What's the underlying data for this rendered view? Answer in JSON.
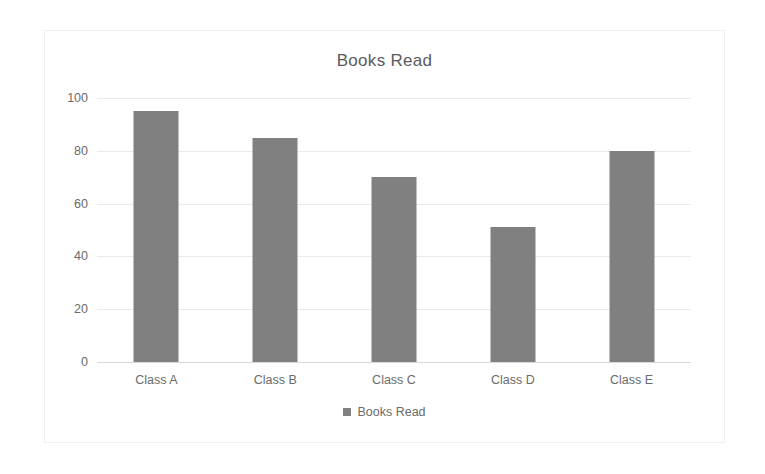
{
  "chart_data": {
    "type": "bar",
    "title": "Books Read",
    "xlabel": "",
    "ylabel": "",
    "categories": [
      "Class A",
      "Class B",
      "Class C",
      "Class D",
      "Class E"
    ],
    "values": [
      95,
      85,
      70,
      51,
      80
    ],
    "series": [
      {
        "name": "Books Read",
        "values": [
          95,
          85,
          70,
          51,
          80
        ]
      }
    ],
    "ylim": [
      0,
      100
    ],
    "yticks": [
      0,
      20,
      40,
      60,
      80,
      100
    ],
    "ytick_labels": [
      "0",
      "20",
      "40",
      "60",
      "80",
      "100"
    ],
    "grid": "horizontal",
    "legend_position": "bottom",
    "legend_entries": [
      "Books Read"
    ],
    "bar_color": "#808080",
    "text_color": "#6b6b6b",
    "title_color": "#5b5b5b",
    "gridline_color": "#eaeaea",
    "plot_background": "#ffffff"
  }
}
